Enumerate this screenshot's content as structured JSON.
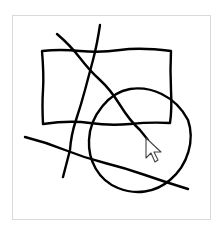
{
  "canvas": {
    "background": "#ffffff",
    "border_color": "#d9d9d9",
    "stroke_color": "#000000",
    "shapes": [
      {
        "type": "rectangle",
        "label": "rectangle"
      },
      {
        "type": "circle",
        "label": "circle"
      },
      {
        "type": "line",
        "label": "diagonal-line"
      },
      {
        "type": "line",
        "label": "vertical-line"
      },
      {
        "type": "line",
        "label": "horizontal-line"
      }
    ]
  },
  "cursor": {
    "icon": "arrow-pointer-icon"
  },
  "caption": ""
}
